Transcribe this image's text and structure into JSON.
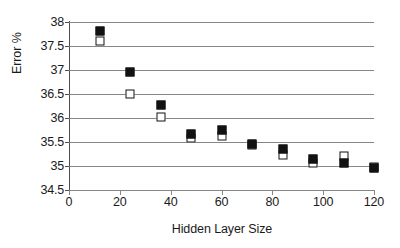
{
  "chart_data": {
    "type": "scatter",
    "title": "",
    "xlabel": "Hidden Layer Size",
    "ylabel": "Error %",
    "xlim": [
      0,
      120
    ],
    "ylim": [
      34.5,
      38
    ],
    "xticks": [
      0,
      20,
      40,
      60,
      80,
      100,
      120
    ],
    "yticks": [
      34.5,
      35,
      35.5,
      36,
      36.5,
      37,
      37.5,
      38
    ],
    "xtick_labels": [
      "0",
      "20",
      "40",
      "60",
      "80",
      "100",
      "120"
    ],
    "ytick_labels": [
      "34.5",
      "35",
      "35.5",
      "36",
      "36.5",
      "37",
      "37.5",
      "38"
    ],
    "grid": "horizontal",
    "legend": "none",
    "x": [
      12,
      24,
      36,
      48,
      60,
      72,
      84,
      96,
      108,
      120
    ],
    "series": [
      {
        "name": "filled-square-series",
        "marker": "filled-square",
        "color": "#121212",
        "values": [
          37.82,
          36.96,
          36.28,
          35.67,
          35.75,
          35.45,
          35.35,
          35.15,
          35.07,
          34.95
        ]
      },
      {
        "name": "open-square-series",
        "marker": "open-square",
        "color": "#ffffff",
        "values": [
          37.6,
          36.5,
          36.03,
          35.58,
          35.62,
          35.43,
          35.22,
          35.07,
          35.2,
          34.97
        ]
      }
    ]
  }
}
